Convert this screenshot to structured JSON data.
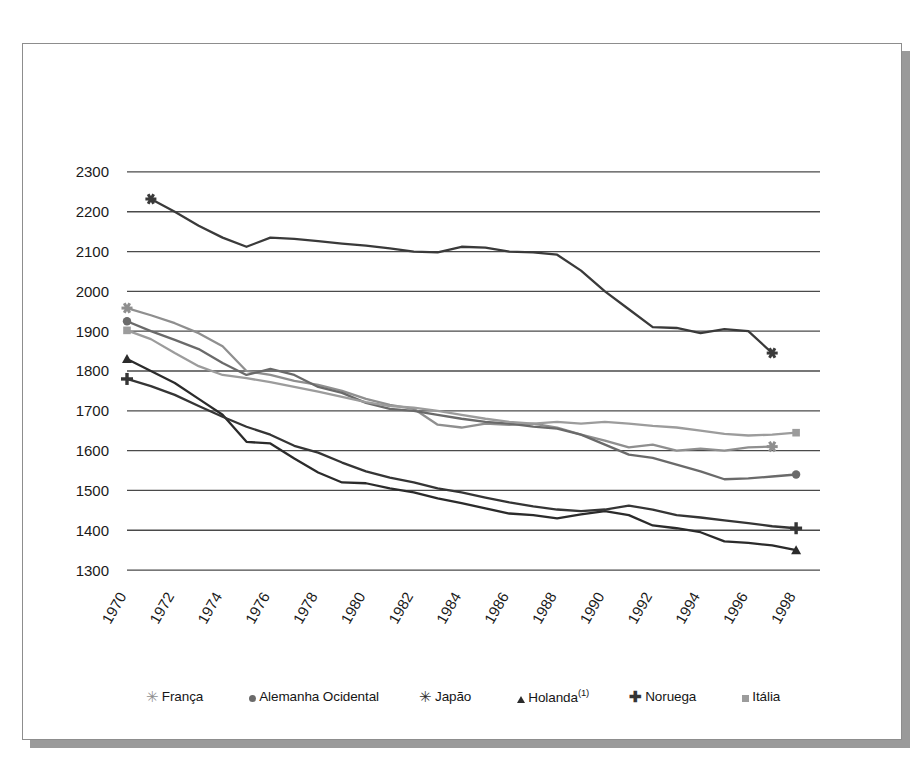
{
  "chart_data": {
    "type": "line",
    "title": "",
    "subtitle": "",
    "xlabel": "",
    "ylabel": "",
    "xlim": [
      1970,
      1999
    ],
    "ylim": [
      1280,
      2340
    ],
    "yticks": [
      1300,
      1400,
      1500,
      1600,
      1700,
      1800,
      1900,
      2000,
      2100,
      2200,
      2300
    ],
    "xticks": [
      1970,
      1972,
      1974,
      1976,
      1978,
      1980,
      1982,
      1984,
      1986,
      1988,
      1990,
      1992,
      1994,
      1996,
      1998
    ],
    "grid": "horizontal",
    "legend_position": "bottom",
    "x": [
      1970,
      1971,
      1972,
      1973,
      1974,
      1975,
      1976,
      1977,
      1978,
      1979,
      1980,
      1981,
      1982,
      1983,
      1984,
      1985,
      1986,
      1987,
      1988,
      1989,
      1990,
      1991,
      1992,
      1993,
      1994,
      1995,
      1996,
      1997,
      1998
    ],
    "series": [
      {
        "name": "França",
        "marker": "asterisk",
        "color": "#8f8f8f",
        "x": [
          1970,
          1971,
          1972,
          1973,
          1974,
          1975,
          1976,
          1977,
          1978,
          1979,
          1980,
          1981,
          1982,
          1983,
          1984,
          1985,
          1986,
          1987,
          1988,
          1989,
          1990,
          1991,
          1992,
          1993,
          1994,
          1995,
          1996,
          1997
        ],
        "values": [
          1958,
          1940,
          1920,
          1895,
          1862,
          1800,
          1790,
          1775,
          1765,
          1750,
          1730,
          1715,
          1705,
          1665,
          1658,
          1668,
          1665,
          1668,
          1658,
          1640,
          1625,
          1608,
          1615,
          1600,
          1605,
          1600,
          1608,
          1610
        ]
      },
      {
        "name": "Alemanha Ocidental",
        "marker": "circle",
        "color": "#6a6a6a",
        "x": [
          1970,
          1971,
          1972,
          1973,
          1974,
          1975,
          1976,
          1977,
          1978,
          1979,
          1980,
          1981,
          1982,
          1983,
          1984,
          1985,
          1986,
          1987,
          1988,
          1989,
          1990,
          1991,
          1992,
          1993,
          1994,
          1995,
          1996,
          1997,
          1998
        ],
        "values": [
          1925,
          1900,
          1878,
          1855,
          1820,
          1790,
          1805,
          1790,
          1760,
          1745,
          1720,
          1705,
          1700,
          1690,
          1680,
          1672,
          1668,
          1660,
          1655,
          1640,
          1615,
          1590,
          1582,
          1565,
          1548,
          1528,
          1530,
          1535,
          1540
        ]
      },
      {
        "name": "Japão",
        "marker": "asterisk-dark",
        "color": "#3a3a3a",
        "x": [
          1971,
          1972,
          1973,
          1974,
          1975,
          1976,
          1977,
          1978,
          1979,
          1980,
          1981,
          1982,
          1983,
          1984,
          1985,
          1986,
          1987,
          1988,
          1989,
          1990,
          1991,
          1992,
          1993,
          1994,
          1995,
          1996,
          1997
        ],
        "values": [
          2232,
          2200,
          2165,
          2135,
          2112,
          2135,
          2132,
          2126,
          2120,
          2115,
          2108,
          2100,
          2098,
          2112,
          2110,
          2100,
          2098,
          2092,
          2052,
          2000,
          1955,
          1910,
          1908,
          1895,
          1905,
          1900,
          1845
        ]
      },
      {
        "name": "Holanda",
        "marker": "triangle",
        "color": "#2b2b2b",
        "superscript": "(1)",
        "x": [
          1970,
          1971,
          1972,
          1973,
          1974,
          1975,
          1976,
          1977,
          1978,
          1979,
          1980,
          1981,
          1982,
          1983,
          1984,
          1985,
          1986,
          1987,
          1988,
          1989,
          1990,
          1991,
          1992,
          1993,
          1994,
          1995,
          1996,
          1997,
          1998
        ],
        "values": [
          1830,
          1800,
          1770,
          1730,
          1690,
          1622,
          1618,
          1580,
          1545,
          1520,
          1518,
          1505,
          1495,
          1480,
          1468,
          1455,
          1442,
          1438,
          1430,
          1440,
          1448,
          1438,
          1412,
          1405,
          1395,
          1372,
          1368,
          1362,
          1350
        ]
      },
      {
        "name": "Noruega",
        "marker": "plus",
        "color": "#353535",
        "x": [
          1970,
          1971,
          1972,
          1973,
          1974,
          1975,
          1976,
          1977,
          1978,
          1979,
          1980,
          1981,
          1982,
          1983,
          1984,
          1985,
          1986,
          1987,
          1988,
          1989,
          1990,
          1991,
          1992,
          1993,
          1994,
          1995,
          1996,
          1997,
          1998
        ],
        "values": [
          1780,
          1762,
          1740,
          1712,
          1685,
          1660,
          1640,
          1612,
          1595,
          1570,
          1548,
          1532,
          1520,
          1505,
          1495,
          1482,
          1470,
          1460,
          1452,
          1448,
          1452,
          1462,
          1452,
          1438,
          1432,
          1425,
          1418,
          1410,
          1405
        ]
      },
      {
        "name": "Itália",
        "marker": "square",
        "color": "#9c9c9c",
        "x": [
          1970,
          1971,
          1972,
          1973,
          1974,
          1975,
          1976,
          1977,
          1978,
          1979,
          1980,
          1981,
          1982,
          1983,
          1984,
          1985,
          1986,
          1987,
          1988,
          1989,
          1990,
          1991,
          1992,
          1993,
          1994,
          1995,
          1996,
          1997,
          1998
        ],
        "values": [
          1902,
          1880,
          1845,
          1812,
          1790,
          1782,
          1772,
          1760,
          1748,
          1735,
          1722,
          1712,
          1708,
          1700,
          1690,
          1680,
          1672,
          1668,
          1672,
          1668,
          1672,
          1668,
          1662,
          1658,
          1650,
          1642,
          1638,
          1640,
          1645
        ]
      }
    ]
  },
  "legend": {
    "items": [
      {
        "label": "França",
        "marker": "asterisk",
        "color": "#8f8f8f",
        "sup": ""
      },
      {
        "label": "Alemanha Ocidental",
        "marker": "circle",
        "color": "#6a6a6a",
        "sup": ""
      },
      {
        "label": "Japão",
        "marker": "asterisk-dark",
        "color": "#2f2f2f",
        "sup": ""
      },
      {
        "label": "Holanda",
        "marker": "triangle",
        "color": "#2b2b2b",
        "sup": "(1)"
      },
      {
        "label": "Noruega",
        "marker": "plus",
        "color": "#353535",
        "sup": ""
      },
      {
        "label": "Itália",
        "marker": "square",
        "color": "#9c9c9c",
        "sup": ""
      }
    ]
  },
  "colors": {
    "gridline": "#4a4a4a",
    "frame_border": "#8d8d8d",
    "shadow": "#9a9a9a",
    "background": "#ffffff",
    "tick_text": "#1a1a1a"
  }
}
